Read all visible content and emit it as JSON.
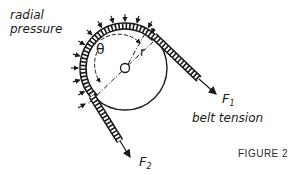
{
  "figure": {
    "caption": "FIGURE 2",
    "labels": {
      "radial_pressure_line1": "radial",
      "radial_pressure_line2": "pressure",
      "theta": "θ",
      "radius": "r",
      "f1_main": "F",
      "f1_sub": "1",
      "f2_main": "F",
      "f2_sub": "2",
      "belt_tension": "belt tension"
    },
    "colors": {
      "ink": "#1a1a1a",
      "background": "#ffffff"
    }
  }
}
